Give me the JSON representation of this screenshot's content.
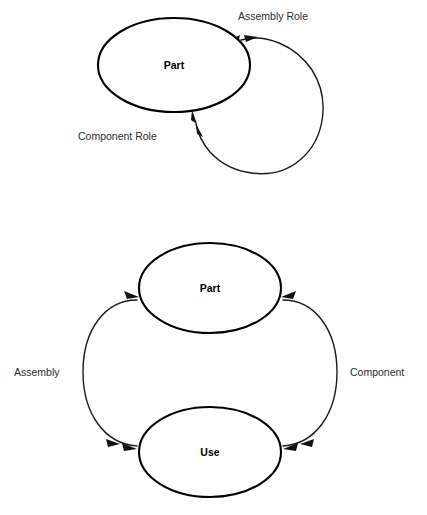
{
  "page": {
    "background_color": "#ffffff",
    "stroke_color": "#000000",
    "text_color": "#000000",
    "width": 427,
    "height": 515
  },
  "diagram_top": {
    "name": "self-referential-association",
    "nodes": [
      {
        "id": "part",
        "label": "Part",
        "cx": 174,
        "cy": 65,
        "rx": 76,
        "ry": 47
      }
    ],
    "edges": [
      {
        "id": "assembly-role",
        "label": "Assembly Role",
        "label_x": 238,
        "label_y": 17,
        "label_anchor": "start",
        "direction": "into-part-upper-right"
      },
      {
        "id": "component-role",
        "label": "Component Role",
        "label_x": 78,
        "label_y": 137,
        "label_anchor": "start",
        "direction": "into-part-lower-left"
      }
    ]
  },
  "diagram_bottom": {
    "name": "part-use-association",
    "nodes": [
      {
        "id": "part",
        "label": "Part",
        "cx": 210,
        "cy": 288,
        "rx": 71,
        "ry": 45
      },
      {
        "id": "use",
        "label": "Use",
        "cx": 210,
        "cy": 452,
        "rx": 71,
        "ry": 45
      }
    ],
    "edges": [
      {
        "id": "assembly",
        "label": "Assembly",
        "label_x": 14,
        "label_y": 373,
        "label_anchor": "start",
        "from": "use",
        "to": "part",
        "side": "left"
      },
      {
        "id": "component",
        "label": "Component",
        "label_x": 350,
        "label_y": 373,
        "label_anchor": "start",
        "from": "part",
        "to": "use",
        "side": "right"
      }
    ]
  }
}
